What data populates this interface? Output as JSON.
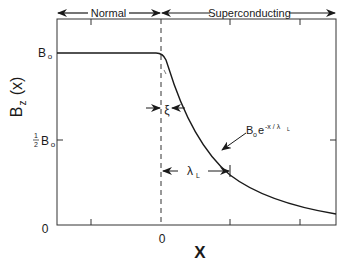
{
  "diagram": {
    "regions": [
      {
        "label": "Normal"
      },
      {
        "label": "Superconducting"
      }
    ],
    "y_axis": {
      "label_main": "B",
      "label_sub": "z",
      "label_arg": "(x)",
      "ticks": [
        {
          "main": "B",
          "sub": "o"
        },
        {
          "frac_num": "1",
          "frac_den": "2",
          "main": "B",
          "sub": "o"
        },
        {
          "main": "0"
        }
      ]
    },
    "x_axis": {
      "label": "X",
      "ticks": [
        {
          "label": "0"
        }
      ]
    },
    "annotations": {
      "coherence_length": "ξ",
      "penetration_depth_main": "λ",
      "penetration_depth_sub": "L",
      "curve_formula_B": "B",
      "curve_formula_sub": "o",
      "curve_formula_e": "e",
      "curve_formula_exp": "-x / λ",
      "curve_formula_exp_sub": "L"
    }
  }
}
